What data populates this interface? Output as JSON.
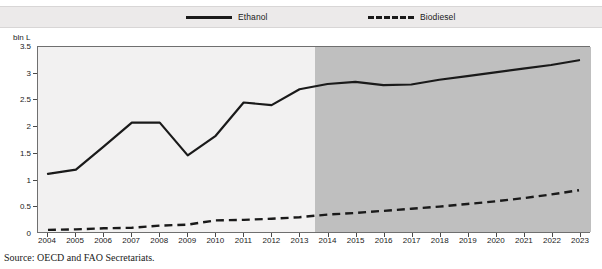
{
  "figure": {
    "title": "",
    "source_text": "Source:  OECD and FAO Secretariats.",
    "y_unit_label": "bln L"
  },
  "legend": {
    "position": "top",
    "items": [
      {
        "label": "Ethanol",
        "style": "solid"
      },
      {
        "label": "Biodiesel",
        "style": "dashed"
      }
    ]
  },
  "colors": {
    "line": "#1a1a1a",
    "plot_background_historical": "#f2f1f1",
    "plot_background_projection": "#bfbfbf",
    "legend_background": "#eceaea",
    "axis": "#6f6f6f"
  },
  "chart_data": {
    "type": "line",
    "title": "",
    "xlabel": "",
    "ylabel": "bln L",
    "ylim": [
      0,
      3.5
    ],
    "ytick_labels": [
      "0",
      "0.5",
      "1",
      "1.5",
      "2",
      "2.5",
      "3",
      "3.5"
    ],
    "ytick_values": [
      0,
      0.5,
      1,
      1.5,
      2,
      2.5,
      3,
      3.5
    ],
    "grid": false,
    "legend_position": "top",
    "categories": [
      "2004",
      "2005",
      "2006",
      "2007",
      "2008",
      "2009",
      "2010",
      "2011",
      "2012",
      "2013",
      "2014",
      "2015",
      "2016",
      "2017",
      "2018",
      "2019",
      "2020",
      "2021",
      "2022",
      "2023"
    ],
    "projection_starts_at": "2013.5",
    "series": [
      {
        "name": "Ethanol",
        "style": "solid",
        "values": [
          1.1,
          1.18,
          1.62,
          2.07,
          2.07,
          1.45,
          1.82,
          2.45,
          2.4,
          2.7,
          2.8,
          2.84,
          2.78,
          2.79,
          2.88,
          2.95,
          3.02,
          3.09,
          3.16,
          3.25
        ]
      },
      {
        "name": "Biodiesel",
        "style": "dashed",
        "values": [
          0.04,
          0.05,
          0.07,
          0.08,
          0.12,
          0.14,
          0.22,
          0.23,
          0.25,
          0.28,
          0.33,
          0.36,
          0.4,
          0.44,
          0.48,
          0.53,
          0.58,
          0.64,
          0.71,
          0.79
        ]
      }
    ]
  }
}
